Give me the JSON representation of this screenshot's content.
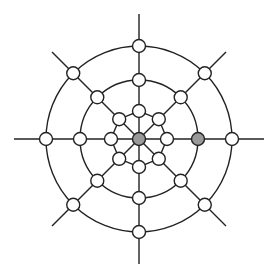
{
  "diagram": {
    "title": "",
    "type": "radial-web-graph",
    "center": {
      "x": 139,
      "y": 139
    },
    "colors": {
      "line": "#222222",
      "node_fill": "#ffffff",
      "highlight_fill": "#999999",
      "background": "#ffffff"
    },
    "spoke_length": 125,
    "spoke_count": 8,
    "diagonal_spoke_length": 123,
    "node_radius": 6.5,
    "rings": [
      {
        "name": "inner",
        "radius": 28,
        "shape": "octagon"
      },
      {
        "name": "middle",
        "radius": 59,
        "shape": "circle"
      },
      {
        "name": "outer",
        "radius": 93,
        "shape": "circle"
      }
    ],
    "highlighted_nodes": [
      {
        "ring": "center",
        "angle": 0
      },
      {
        "ring": "middle",
        "angle": 0
      }
    ],
    "node_count": 25
  }
}
